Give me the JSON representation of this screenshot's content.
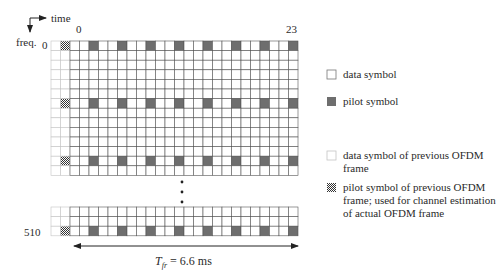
{
  "axes": {
    "time_label": "time",
    "freq_label": "freq."
  },
  "grid": {
    "current_frame_symbols": 24,
    "previous_frame_columns": 2,
    "pilot_symbol_indices": [
      2,
      5,
      8,
      11,
      14,
      17,
      20,
      23
    ],
    "upper_block_rows": 14,
    "pilot_rows_upper": [
      0,
      6,
      12
    ],
    "lower_block_rows": 3,
    "pilot_rows_lower": [
      2
    ],
    "col_label_first": "0",
    "col_label_last": "23",
    "row_label_first": "0",
    "row_label_last": "510"
  },
  "frame_duration": {
    "symbol": "T",
    "subscript": "fr",
    "value_text": " = 6.6 ms"
  },
  "legend": {
    "items": [
      {
        "key": "data",
        "label": "data symbol"
      },
      {
        "key": "pilot",
        "label": "pilot symbol"
      },
      {
        "key": "prev-data",
        "label": "data symbol of previous OFDM\nframe"
      },
      {
        "key": "prev-pilot",
        "label": "pilot symbol of previous OFDM\nframe; used for channel estimation\nof actual OFDM frame"
      }
    ]
  },
  "colors": {
    "pilot": "#6e6e6e",
    "grid_line": "#555555",
    "prev_grid_line": "#c4c4c4",
    "checker_dark": "#333333",
    "checker_light": "#ffffff"
  }
}
